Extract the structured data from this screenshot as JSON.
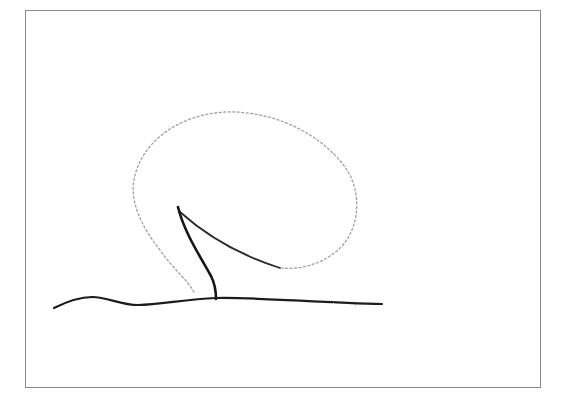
{
  "figure": {
    "colors": {
      "background": "#ffffff",
      "frame": "#8a8a8a",
      "ink_dark": "#1a1a1a",
      "ink_light": "#9a9a9a"
    },
    "elements": [
      "frame",
      "canopy-outline",
      "trunk",
      "branch",
      "ground-line"
    ]
  }
}
